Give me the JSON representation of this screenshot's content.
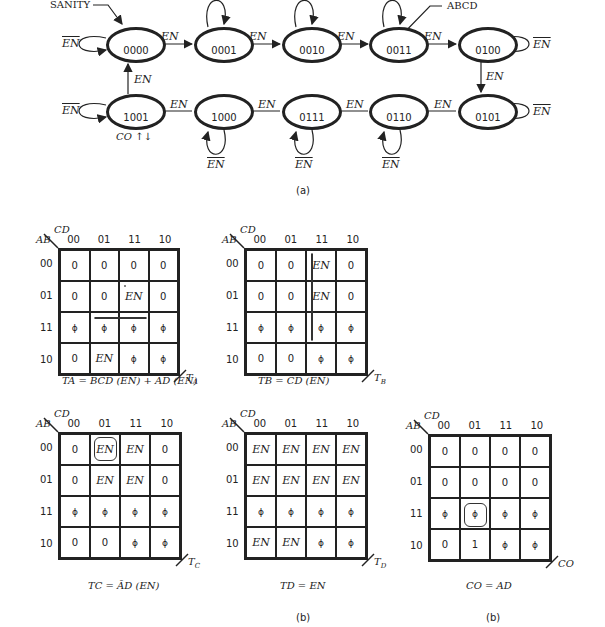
{
  "state_diagram": {
    "entry_label": "SANITY",
    "pointer_label": "ABCD",
    "states": [
      "0000",
      "0001",
      "0010",
      "0011",
      "0100",
      "0101",
      "0110",
      "0111",
      "1000",
      "1001"
    ],
    "transition_label": "EN",
    "hold_label": "EN",
    "output_label": "CO ↑↓",
    "figure_label": "(a)"
  },
  "kmaps": {
    "col_var": "CD",
    "row_var": "AB",
    "col_headers": [
      "00",
      "01",
      "11",
      "10"
    ],
    "row_headers": [
      "00",
      "01",
      "11",
      "10"
    ],
    "phi": "ϕ",
    "maps": [
      {
        "name": "TA",
        "output": "TA",
        "caption": "T_A = BCD (EN) + AD (EN)",
        "cells": [
          [
            "0",
            "0",
            "0",
            "0"
          ],
          [
            "0",
            "0",
            "EN",
            "0"
          ],
          [
            "ϕ",
            "ϕ",
            "ϕ",
            "ϕ"
          ],
          [
            "0",
            "EN",
            "ϕ",
            "ϕ"
          ]
        ]
      },
      {
        "name": "TB",
        "output": "TB",
        "caption": "T_B = CD (EN)",
        "cells": [
          [
            "0",
            "0",
            "EN",
            "0"
          ],
          [
            "0",
            "0",
            "EN",
            "0"
          ],
          [
            "ϕ",
            "ϕ",
            "ϕ",
            "ϕ"
          ],
          [
            "0",
            "0",
            "ϕ",
            "ϕ"
          ]
        ]
      },
      {
        "name": "TC",
        "output": "TC",
        "caption": "T_C = ĀD (EN)",
        "cells": [
          [
            "0",
            "EN",
            "EN",
            "0"
          ],
          [
            "0",
            "EN",
            "EN",
            "0"
          ],
          [
            "ϕ",
            "ϕ",
            "ϕ",
            "ϕ"
          ],
          [
            "0",
            "0",
            "ϕ",
            "ϕ"
          ]
        ]
      },
      {
        "name": "TD",
        "output": "TD",
        "caption": "T_D = EN",
        "cells": [
          [
            "EN",
            "EN",
            "EN",
            "EN"
          ],
          [
            "EN",
            "EN",
            "EN",
            "EN"
          ],
          [
            "ϕ",
            "ϕ",
            "ϕ",
            "ϕ"
          ],
          [
            "EN",
            "EN",
            "ϕ",
            "ϕ"
          ]
        ]
      },
      {
        "name": "CO",
        "output": "CO",
        "caption": "CO = AD",
        "cells": [
          [
            "0",
            "0",
            "0",
            "0"
          ],
          [
            "0",
            "0",
            "0",
            "0"
          ],
          [
            "ϕ",
            "ϕ",
            "ϕ",
            "ϕ"
          ],
          [
            "0",
            "1",
            "ϕ",
            "ϕ"
          ]
        ]
      }
    ],
    "figure_label_1": "(b)",
    "figure_label_2": "(b)"
  }
}
